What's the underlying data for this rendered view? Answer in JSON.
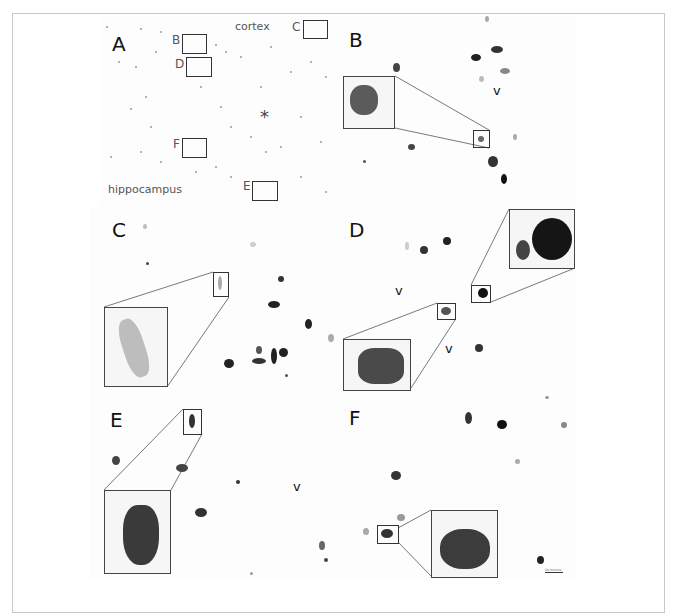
{
  "figure": {
    "panels": [
      {
        "id": "A",
        "label": "A",
        "annotations": [
          "cortex",
          "hippocampus",
          "*"
        ],
        "region_boxes": [
          "B",
          "C",
          "D",
          "E",
          "F"
        ]
      },
      {
        "id": "B",
        "label": "B",
        "markers": [
          "v"
        ]
      },
      {
        "id": "C",
        "label": "C",
        "markers": []
      },
      {
        "id": "D",
        "label": "D",
        "markers": [
          "v",
          "v"
        ]
      },
      {
        "id": "E",
        "label": "E",
        "markers": [
          "v"
        ]
      },
      {
        "id": "F",
        "label": "F",
        "markers": []
      }
    ],
    "panel_a": {
      "label": "A",
      "cortex": "cortex",
      "hippocampus": "hippocampus",
      "asterisk": "*",
      "box_labels": {
        "B": "B",
        "C": "C",
        "D": "D",
        "E": "E",
        "F": "F"
      }
    },
    "panel_b": {
      "label": "B",
      "v": "v"
    },
    "panel_c": {
      "label": "C"
    },
    "panel_d": {
      "label": "D",
      "v1": "v",
      "v2": "v"
    },
    "panel_e": {
      "label": "E",
      "v": "v"
    },
    "panel_f": {
      "label": "F"
    },
    "scale_bar": {
      "label": "20 microns"
    }
  }
}
